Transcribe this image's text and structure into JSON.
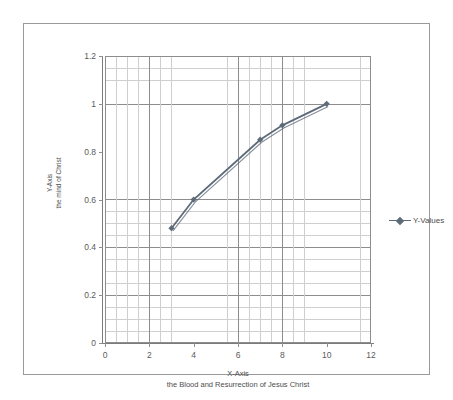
{
  "chart_data": {
    "type": "line",
    "title": "",
    "xlabel": "X-Axis",
    "xlabel_sub": "the Blood  and Resurrection of Jesus Christ",
    "ylabel": "Y-Axis",
    "ylabel_sub": "the mind of Christ",
    "xlim": [
      0,
      12
    ],
    "ylim": [
      0,
      1.2
    ],
    "grid": true,
    "grid_minor": true,
    "legend_position": "right",
    "series": [
      {
        "name": "Y-Values",
        "color": "#5d6a78",
        "x": [
          3,
          4,
          7,
          8,
          10
        ],
        "values": [
          0.48,
          0.6,
          0.85,
          0.91,
          1.0
        ]
      }
    ],
    "xticks": [
      "0",
      "2",
      "4",
      "6",
      "8",
      "10",
      "12"
    ],
    "xtick_values": [
      0,
      2,
      4,
      6,
      8,
      10,
      12
    ],
    "yticks": [
      "0",
      "0.2",
      "0.4",
      "0.6",
      "0.8",
      "1",
      "1.2"
    ],
    "ytick_values": [
      0,
      0.2,
      0.4,
      0.6,
      0.8,
      1,
      1.2
    ]
  },
  "legend": {
    "entries": [
      {
        "label": "Y-Values"
      }
    ]
  },
  "axes": {
    "x_title": "X-Axis",
    "x_subtitle": "the Blood  and Resurrection of Jesus Christ",
    "y_title": "Y-Axis",
    "y_subtitle": "the mind of Christ"
  }
}
